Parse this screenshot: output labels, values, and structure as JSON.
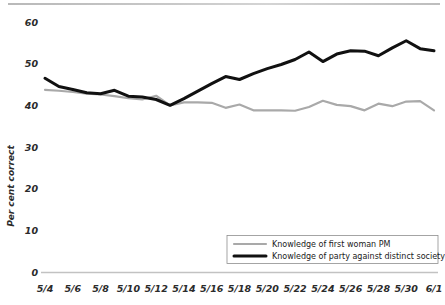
{
  "chart_data": {
    "type": "line",
    "title": "",
    "xlabel": "",
    "ylabel": "Per cent correct",
    "ylim": [
      0,
      60
    ],
    "yticks": [
      0,
      10,
      20,
      30,
      40,
      50,
      60
    ],
    "grid": false,
    "legend_position": "bottom-right",
    "x": [
      "5/4",
      "5/5",
      "5/6",
      "5/7",
      "5/8",
      "5/9",
      "5/10",
      "5/11",
      "5/12",
      "5/13",
      "5/14",
      "5/15",
      "5/16",
      "5/17",
      "5/18",
      "5/19",
      "5/20",
      "5/21",
      "5/22",
      "5/23",
      "5/24",
      "5/25",
      "5/26",
      "5/27",
      "5/28",
      "5/29",
      "5/30",
      "5/31",
      "6/1"
    ],
    "xtick_labels": [
      "5/4",
      "5/6",
      "5/8",
      "5/10",
      "5/12",
      "5/14",
      "5/16",
      "5/18",
      "5/20",
      "5/22",
      "5/24",
      "5/26",
      "5/28",
      "5/30",
      "6/1"
    ],
    "series": [
      {
        "name": "Knowledge of first woman PM",
        "color": "#a9a9a9",
        "width": 2.2,
        "values": [
          43.7,
          43.5,
          43.2,
          42.8,
          42.6,
          42.2,
          41.7,
          41.4,
          42.3,
          40.0,
          40.7,
          40.7,
          40.6,
          39.4,
          40.2,
          38.8,
          38.8,
          38.8,
          38.7,
          39.6,
          41.1,
          40.1,
          39.8,
          38.8,
          40.4,
          39.8,
          40.9,
          41.0,
          38.8
        ]
      },
      {
        "name": "Knowledge of party against distinct society",
        "color": "#111111",
        "width": 3.0,
        "values": [
          46.5,
          44.5,
          43.8,
          43.0,
          42.8,
          43.6,
          42.2,
          42.0,
          41.4,
          40.0,
          41.6,
          43.4,
          45.2,
          46.9,
          46.2,
          47.6,
          48.8,
          49.8,
          51.0,
          52.8,
          50.5,
          52.3,
          53.1,
          53.0,
          51.9,
          53.8,
          55.5,
          53.6,
          53.1
        ]
      }
    ]
  },
  "legend": {
    "items": [
      {
        "label": "Knowledge of first woman PM"
      },
      {
        "label": "Knowledge of party against distinct society"
      }
    ]
  }
}
